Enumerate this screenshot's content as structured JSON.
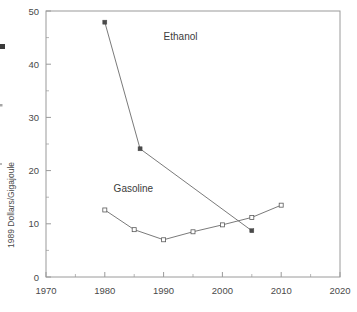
{
  "chart_data": {
    "type": "line",
    "title": "",
    "xlabel": "",
    "ylabel": "1989 Dollars/Gigajoule",
    "xlim": [
      1970,
      2020
    ],
    "ylim": [
      0,
      50
    ],
    "xticks": [
      1970,
      1980,
      1990,
      2000,
      2010,
      2020
    ],
    "xtick_labels": [
      "1970",
      "1980",
      "1990",
      "2000",
      "2010",
      "2020"
    ],
    "yticks": [
      0,
      10,
      20,
      30,
      40,
      50
    ],
    "ytick_labels": [
      "0",
      "10",
      "20",
      "30",
      "40",
      "50"
    ],
    "minor_yticks": [
      5,
      15,
      25,
      35,
      45
    ],
    "minor_xticks": [
      1975,
      1985,
      1995,
      2005,
      2015
    ],
    "grid": false,
    "legend": "inline-annotations",
    "series": [
      {
        "name": "Ethanol",
        "marker": "filled-square",
        "x": [
          1980,
          1986,
          2005
        ],
        "values": [
          47.9,
          24.1,
          8.7
        ],
        "label": "Ethanol",
        "label_x": 1990,
        "label_y": 44.5
      },
      {
        "name": "Gasoline",
        "marker": "open-square",
        "x": [
          1980,
          1985,
          1990,
          1995,
          2000,
          2005,
          2010
        ],
        "values": [
          12.6,
          8.9,
          7.0,
          8.5,
          9.8,
          11.2,
          13.5
        ],
        "label": "Gasoline",
        "label_x": 1981.5,
        "label_y": 16.0
      }
    ],
    "colors": {
      "axis": "#9a9a9a",
      "line": "#6b6b6b",
      "marker": "#4a4a4a",
      "text": "#4a4a4a",
      "background": "#ffffff"
    }
  }
}
